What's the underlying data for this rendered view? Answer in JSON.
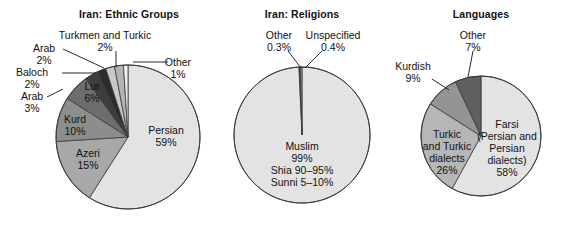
{
  "figure": {
    "background": "#ffffff",
    "stroke": "#3a3a3a"
  },
  "charts": [
    {
      "id": "ethnic-groups",
      "title": "Iran: Ethnic Groups",
      "title_x": 129,
      "title_y": 18,
      "cx": 128,
      "cy": 137,
      "r": 72,
      "labels": [
        {
          "name": "persian",
          "lines": [
            "Persian",
            "59%"
          ],
          "x": 166,
          "y": 134,
          "anchor": "middle",
          "tone": "dark",
          "leader": null
        },
        {
          "name": "azeri",
          "lines": [
            "Azeri",
            "15%"
          ],
          "x": 88,
          "y": 157,
          "anchor": "middle",
          "tone": "dark",
          "leader": null
        },
        {
          "name": "kurd",
          "lines": [
            "Kurd",
            "10%"
          ],
          "x": 75,
          "y": 123,
          "anchor": "middle",
          "tone": "dark",
          "leader": null
        },
        {
          "name": "lur",
          "lines": [
            "Lur",
            "6%"
          ],
          "x": 92,
          "y": 90,
          "anchor": "middle",
          "tone": "light",
          "leader": null
        },
        {
          "name": "arab-3",
          "lines": [
            "Arab",
            "3%"
          ],
          "x": 32,
          "y": 100,
          "anchor": "middle",
          "tone": "dark",
          "leader": "M47,97 L63,89"
        },
        {
          "name": "baloch-2",
          "lines": [
            "Baloch",
            "2%"
          ],
          "x": 32,
          "y": 76,
          "anchor": "middle",
          "tone": "dark",
          "leader": "M62,73 L96,73"
        },
        {
          "name": "arab-2",
          "lines": [
            "Arab",
            "2%"
          ],
          "x": 44,
          "y": 52,
          "anchor": "middle",
          "tone": "dark",
          "leader": "M63,49 L104,68"
        },
        {
          "name": "turkmen-and-turkic-2",
          "lines": [
            "Turkmen and Turkic",
            "2%"
          ],
          "x": 105,
          "y": 39,
          "anchor": "middle",
          "tone": "dark",
          "leader": "M116,51 L116,67"
        },
        {
          "name": "other-1",
          "lines": [
            "Other",
            "1%"
          ],
          "x": 178,
          "y": 66,
          "anchor": "middle",
          "tone": "dark",
          "leader": "M133,62 L168,62"
        }
      ],
      "chart_data": {
        "type": "pie",
        "title": "Iran: Ethnic Groups",
        "categories": [
          "Persian",
          "Azeri",
          "Kurd",
          "Lur",
          "Arab",
          "Baloch",
          "Arab",
          "Turkmen and Turkic",
          "Other"
        ],
        "values": [
          59,
          15,
          10,
          6,
          3,
          2,
          2,
          2,
          1
        ],
        "units": "percent",
        "start_angle_deg": 0,
        "direction": "clockwise",
        "colors": [
          "#e3e3e3",
          "#a8a8a8",
          "#8d8d8d",
          "#6d6d6d",
          "#3d3d3d",
          "#2b2b2b",
          "#c9c9c9",
          "#b4b4b4",
          "#efefef"
        ]
      }
    },
    {
      "id": "religions",
      "title": "Iran: Religions",
      "title_x": 302,
      "title_y": 18,
      "cx": 302,
      "cy": 135,
      "r": 68,
      "labels": [
        {
          "name": "muslim",
          "lines": [
            "Muslim",
            "99%",
            "Shia 90–95%",
            "Sunni 5–10%"
          ],
          "x": 302,
          "y": 150,
          "anchor": "middle",
          "tone": "dark",
          "leader": null
        },
        {
          "name": "other-03",
          "lines": [
            "Other",
            "0.3%"
          ],
          "x": 279,
          "y": 39,
          "anchor": "middle",
          "tone": "dark",
          "leader": "M288,51 L301,68"
        },
        {
          "name": "unspecified-04",
          "lines": [
            "Unspecified",
            "0.4%"
          ],
          "x": 333,
          "y": 39,
          "anchor": "middle",
          "tone": "dark",
          "leader": "M322,51 L305,68"
        }
      ],
      "chart_data": {
        "type": "pie",
        "title": "Iran: Religions",
        "categories": [
          "Muslim",
          "Other",
          "Unspecified"
        ],
        "values": [
          99.3,
          0.3,
          0.4
        ],
        "units": "percent",
        "notes": [
          "Muslim 99%",
          "Shia 90–95%",
          "Sunni 5–10%"
        ],
        "start_angle_deg": 0,
        "direction": "clockwise",
        "colors": [
          "#e3e3e3",
          "#2b2b2b",
          "#9a9a9a"
        ]
      }
    },
    {
      "id": "languages",
      "title": "Languages",
      "title_x": 481,
      "title_y": 18,
      "cx": 481,
      "cy": 136,
      "r": 60,
      "labels": [
        {
          "name": "farsi",
          "lines": [
            "Farsi",
            "(Persian and",
            "Persian",
            "dialects)",
            "58%"
          ],
          "x": 507,
          "y": 128,
          "anchor": "middle",
          "tone": "dark",
          "leader": null
        },
        {
          "name": "turkic-and-turkic-dialects",
          "lines": [
            "Turkic",
            "and Turkic",
            "dialects",
            "26%"
          ],
          "x": 447,
          "y": 138,
          "anchor": "middle",
          "tone": "dark",
          "leader": null
        },
        {
          "name": "kurdish",
          "lines": [
            "Kurdish",
            "9%"
          ],
          "x": 413,
          "y": 70,
          "anchor": "middle",
          "tone": "dark",
          "leader": "M432,79 L449,90"
        },
        {
          "name": "other-7",
          "lines": [
            "Other",
            "7%"
          ],
          "x": 473,
          "y": 39,
          "anchor": "middle",
          "tone": "dark",
          "leader": "M473,51 L468,77"
        }
      ],
      "chart_data": {
        "type": "pie",
        "title": "Languages",
        "categories": [
          "Farsi (Persian and Persian dialects)",
          "Turkic and Turkic dialects",
          "Kurdish",
          "Other"
        ],
        "values": [
          58,
          26,
          9,
          7
        ],
        "units": "percent",
        "start_angle_deg": 0,
        "direction": "clockwise",
        "colors": [
          "#e3e3e3",
          "#b6b6b6",
          "#949494",
          "#5f5f5f"
        ]
      }
    }
  ]
}
